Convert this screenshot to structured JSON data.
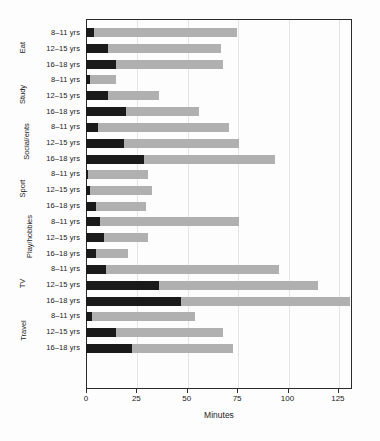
{
  "chart_data": {
    "type": "bar",
    "orientation": "horizontal",
    "stacked": true,
    "title": "",
    "subtitle": "",
    "xlabel": "Minutes",
    "ylabel": "",
    "xlim": [
      0,
      132
    ],
    "xticks": [
      0,
      25,
      50,
      75,
      100,
      125
    ],
    "xtick_labels": [
      "0",
      "25",
      "50",
      "75",
      "100",
      "125"
    ],
    "grid": "vertical",
    "legend": "none",
    "categories": [
      "Eat",
      "Study",
      "Social/ents",
      "Sport",
      "Play/hobbies",
      "TV",
      "Travel"
    ],
    "subcategories": [
      "8-11 yrs",
      "12-15 yrs",
      "16-18 yrs"
    ],
    "series": [
      {
        "name": "dark-segment",
        "color": "#1a1a1a"
      },
      {
        "name": "light-segment",
        "color": "#b0b0b0"
      }
    ],
    "groups": [
      {
        "label": "Eat",
        "bars": [
          {
            "label": "8-11 yrs",
            "dark": 4,
            "total": 75
          },
          {
            "label": "12-15 yrs",
            "dark": 11,
            "total": 67
          },
          {
            "label": "16-18 yrs",
            "dark": 15,
            "total": 68
          }
        ]
      },
      {
        "label": "Study",
        "bars": [
          {
            "label": "8-11 yrs",
            "dark": 2,
            "total": 15
          },
          {
            "label": "12-15 yrs",
            "dark": 11,
            "total": 36
          },
          {
            "label": "16-18 yrs",
            "dark": 20,
            "total": 56
          }
        ]
      },
      {
        "label": "Social/ents",
        "bars": [
          {
            "label": "8-11 yrs",
            "dark": 6,
            "total": 71
          },
          {
            "label": "12-15 yrs",
            "dark": 19,
            "total": 76
          },
          {
            "label": "16-18 yrs",
            "dark": 29,
            "total": 94
          }
        ]
      },
      {
        "label": "Sport",
        "bars": [
          {
            "label": "8-11 yrs",
            "dark": 1,
            "total": 31
          },
          {
            "label": "12-15 yrs",
            "dark": 2,
            "total": 33
          },
          {
            "label": "16-18 yrs",
            "dark": 5,
            "total": 30
          }
        ]
      },
      {
        "label": "Play/hobbies",
        "bars": [
          {
            "label": "8-11 yrs",
            "dark": 7,
            "total": 76
          },
          {
            "label": "12-15 yrs",
            "dark": 9,
            "total": 31
          },
          {
            "label": "16-18 yrs",
            "dark": 5,
            "total": 21
          }
        ]
      },
      {
        "label": "TV",
        "bars": [
          {
            "label": "8-11 yrs",
            "dark": 10,
            "total": 96
          },
          {
            "label": "12-15 yrs",
            "dark": 36,
            "total": 115
          },
          {
            "label": "16-18 yrs",
            "dark": 47,
            "total": 131
          }
        ]
      },
      {
        "label": "Travel",
        "bars": [
          {
            "label": "8-11 yrs",
            "dark": 3,
            "total": 54
          },
          {
            "label": "12-15 yrs",
            "dark": 15,
            "total": 68
          },
          {
            "label": "16-18 yrs",
            "dark": 23,
            "total": 73
          }
        ]
      }
    ]
  }
}
